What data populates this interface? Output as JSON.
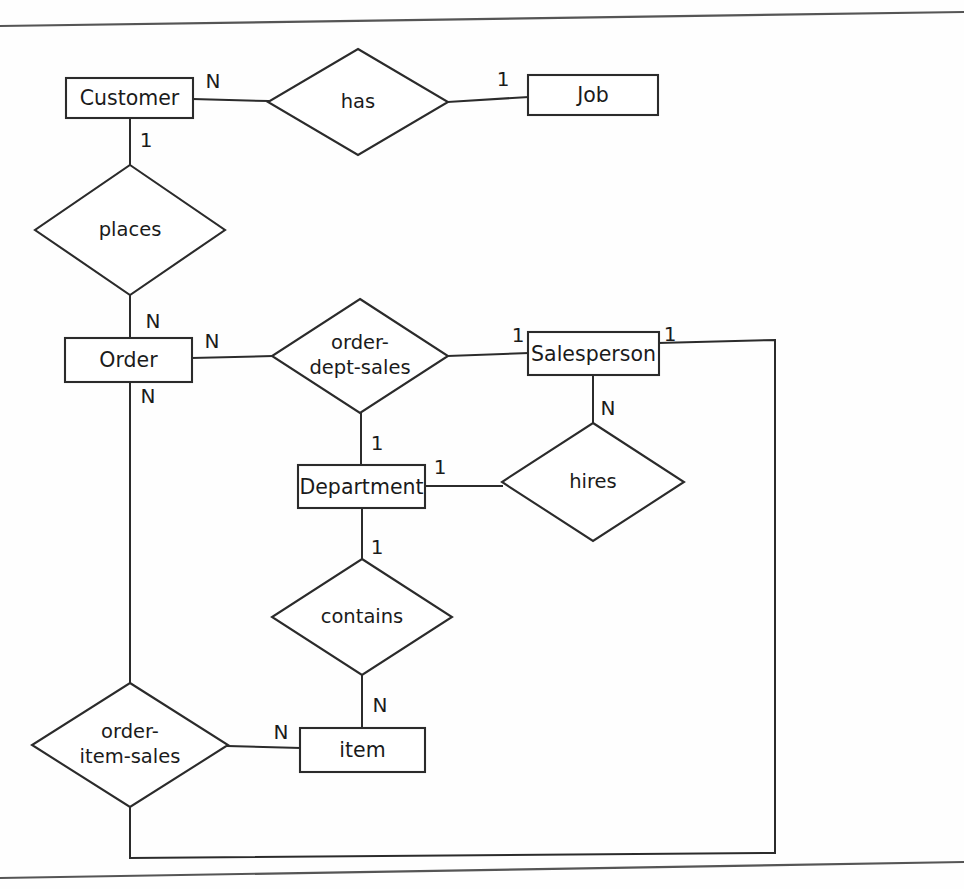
{
  "diagram": {
    "colors": {
      "stroke": "#2b2b2b",
      "background": "#ffffff",
      "text": "#1b1b1b",
      "page_edge": "#555555"
    },
    "entities": [
      {
        "id": "customer",
        "label": "Customer",
        "x": 66,
        "y": 78,
        "w": 127,
        "h": 40
      },
      {
        "id": "job",
        "label": "Job",
        "x": 528,
        "y": 75,
        "w": 130,
        "h": 40
      },
      {
        "id": "order",
        "label": "Order",
        "x": 65,
        "y": 338,
        "w": 127,
        "h": 44
      },
      {
        "id": "salesperson",
        "label": "Salesperson",
        "x": 528,
        "y": 332,
        "w": 131,
        "h": 43
      },
      {
        "id": "department",
        "label": "Department",
        "x": 298,
        "y": 465,
        "w": 127,
        "h": 43
      },
      {
        "id": "item",
        "label": "item",
        "x": 300,
        "y": 728,
        "w": 125,
        "h": 44
      }
    ],
    "relationships": [
      {
        "id": "has",
        "label": "has",
        "lines": [
          "has"
        ],
        "cx": 358,
        "cy": 102,
        "rx": 90,
        "ry": 53
      },
      {
        "id": "places",
        "label": "places",
        "lines": [
          "places"
        ],
        "cx": 130,
        "cy": 230,
        "rx": 95,
        "ry": 65
      },
      {
        "id": "order-dept-sales",
        "label": "order-dept-sales",
        "lines": [
          "order-",
          "dept-sales"
        ],
        "cx": 360,
        "cy": 356,
        "rx": 88,
        "ry": 57
      },
      {
        "id": "hires",
        "label": "hires",
        "lines": [
          "hires"
        ],
        "cx": 593,
        "cy": 482,
        "rx": 91,
        "ry": 59
      },
      {
        "id": "contains",
        "label": "contains",
        "lines": [
          "contains"
        ],
        "cx": 362,
        "cy": 617,
        "rx": 90,
        "ry": 58
      },
      {
        "id": "order-item-sales",
        "label": "order-item-sales",
        "lines": [
          "order-",
          "item-sales"
        ],
        "cx": 130,
        "cy": 745,
        "rx": 98,
        "ry": 62
      }
    ],
    "cardinalities": [
      {
        "id": "customer-has",
        "value": "N",
        "x": 213,
        "y": 82
      },
      {
        "id": "has-job",
        "value": "1",
        "x": 503,
        "y": 80
      },
      {
        "id": "customer-places",
        "value": "1",
        "x": 146,
        "y": 141
      },
      {
        "id": "places-order",
        "value": "N",
        "x": 153,
        "y": 322
      },
      {
        "id": "order-orderdeptsales",
        "value": "N",
        "x": 212,
        "y": 342
      },
      {
        "id": "orderdeptsales-sales",
        "value": "1",
        "x": 518,
        "y": 336
      },
      {
        "id": "salesperson-right",
        "value": "1",
        "x": 670,
        "y": 335
      },
      {
        "id": "salesperson-hires",
        "value": "N",
        "x": 608,
        "y": 409
      },
      {
        "id": "orderdeptsales-dept",
        "value": "1",
        "x": 377,
        "y": 444
      },
      {
        "id": "department-hires",
        "value": "1",
        "x": 440,
        "y": 468
      },
      {
        "id": "department-contains",
        "value": "1",
        "x": 377,
        "y": 548
      },
      {
        "id": "contains-item",
        "value": "N",
        "x": 380,
        "y": 706
      },
      {
        "id": "orderitemsales-item",
        "value": "N",
        "x": 281,
        "y": 733
      },
      {
        "id": "order-orderitemsales",
        "value": "N",
        "x": 148,
        "y": 397
      }
    ],
    "connectors": [
      {
        "id": "customer-to-has",
        "path": "M 193 99 L 268 101"
      },
      {
        "id": "has-to-job",
        "path": "M 448 102 L 528 97"
      },
      {
        "id": "customer-to-places",
        "path": "M 130 118 L 130 166"
      },
      {
        "id": "places-to-order",
        "path": "M 130 295 L 130 338"
      },
      {
        "id": "order-to-orderdeptsales",
        "path": "M 192 358 L 272 356"
      },
      {
        "id": "orderdeptsales-to-salesperson",
        "path": "M 448 356 L 528 353"
      },
      {
        "id": "salesperson-to-hires",
        "path": "M 593 375 L 593 423"
      },
      {
        "id": "orderdeptsales-to-department",
        "path": "M 361 413 L 361 465"
      },
      {
        "id": "department-to-hires",
        "path": "M 425 486 L 502 486"
      },
      {
        "id": "department-to-contains",
        "path": "M 362 508 L 362 560"
      },
      {
        "id": "contains-to-item",
        "path": "M 362 675 L 362 728"
      },
      {
        "id": "orderitemsales-to-item",
        "path": "M 228 746 L 300 748"
      },
      {
        "id": "order-to-orderitemsales",
        "path": "M 130 382 L 130 683"
      },
      {
        "id": "orderitemsales-to-salesperson",
        "path": "M 130 807 L 130 858 L 775 853 L 775 340 L 659 343"
      }
    ],
    "page_edges": [
      {
        "id": "top-edge",
        "path": "M 0 26 L 964 12"
      },
      {
        "id": "bottom-edge",
        "path": "M 0 878 L 964 862"
      }
    ]
  }
}
